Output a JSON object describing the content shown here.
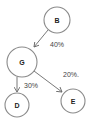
{
  "diagram": {
    "type": "probability-tree",
    "nodes": [
      {
        "id": "B",
        "label": "B",
        "cx": 57,
        "cy": 20,
        "r": 13
      },
      {
        "id": "G",
        "label": "G",
        "cx": 22,
        "cy": 62,
        "r": 15
      },
      {
        "id": "D",
        "label": "D",
        "cx": 17,
        "cy": 105,
        "r": 12
      },
      {
        "id": "E",
        "label": "E",
        "cx": 73,
        "cy": 101,
        "r": 12
      }
    ],
    "edges": [
      {
        "from": "B",
        "to": "G",
        "label": "40%"
      },
      {
        "from": "G",
        "to": "D",
        "label": "30%"
      },
      {
        "from": "G",
        "to": "E",
        "label": "20%."
      }
    ]
  },
  "colors": {
    "node_stroke": "#8a8a8a",
    "edge_stroke": "#6a6a6a",
    "text": "#222222",
    "background": "#ffffff"
  }
}
